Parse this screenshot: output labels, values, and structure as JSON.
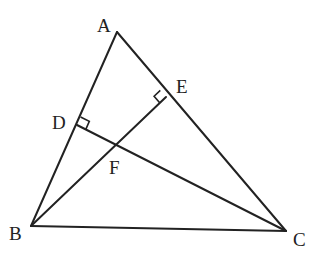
{
  "diagram": {
    "type": "triangle-with-altitudes",
    "points": {
      "A": {
        "label": "A",
        "x": 117,
        "y": 32
      },
      "B": {
        "label": "B",
        "x": 31,
        "y": 226
      },
      "C": {
        "label": "C",
        "x": 286,
        "y": 231
      },
      "D": {
        "label": "D",
        "x": 77,
        "y": 125
      },
      "E": {
        "label": "E",
        "x": 166,
        "y": 97
      },
      "F": {
        "label": "F",
        "x": 114,
        "y": 146
      }
    },
    "segments": [
      "AB",
      "BC",
      "CA",
      "BE",
      "CD"
    ],
    "right_angles": [
      "D (CD ⊥ AB)",
      "E (BE ⊥ AC)"
    ]
  }
}
